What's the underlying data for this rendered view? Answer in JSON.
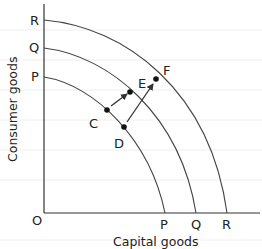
{
  "diagram": {
    "type": "production-possibility-frontier",
    "x_axis_label": "Capital goods",
    "y_axis_label": "Consumer goods",
    "origin_label": "O",
    "curves": [
      {
        "id": "P",
        "y_label": "P",
        "x_label": "P"
      },
      {
        "id": "Q",
        "y_label": "Q",
        "x_label": "Q"
      },
      {
        "id": "R",
        "y_label": "R",
        "x_label": "R"
      }
    ],
    "points": [
      {
        "id": "C",
        "label": "C",
        "curve": "P"
      },
      {
        "id": "D",
        "label": "D",
        "curve": "P"
      },
      {
        "id": "E",
        "label": "E",
        "curve": "Q"
      },
      {
        "id": "F",
        "label": "F",
        "curve": "R"
      }
    ],
    "arrows": [
      {
        "from": "C",
        "to": "E"
      },
      {
        "from": "D",
        "to": "F"
      }
    ],
    "colors": {
      "line": "#333333",
      "grid": "#eeeeee",
      "background": "#ffffff"
    }
  }
}
